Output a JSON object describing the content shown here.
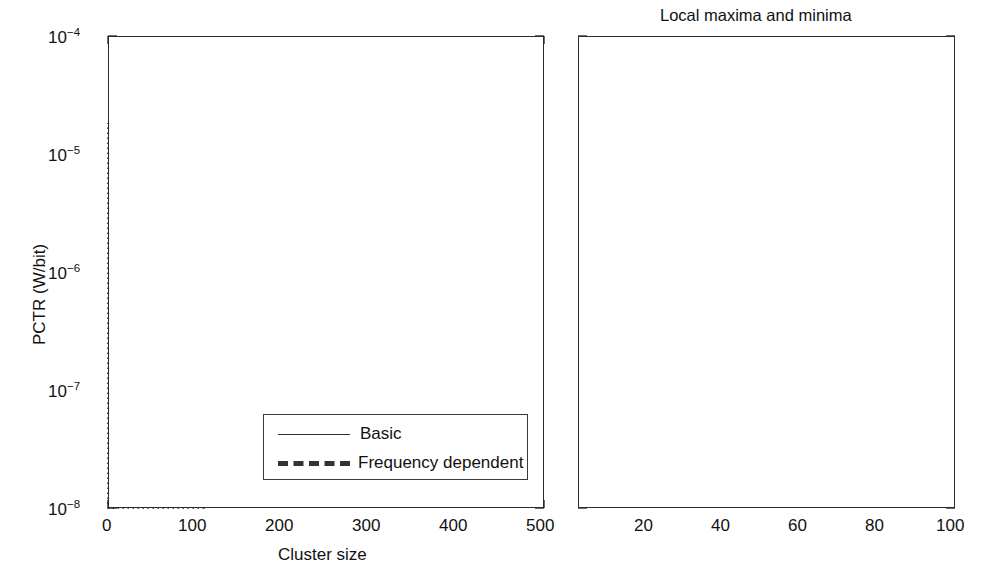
{
  "figure": {
    "background": "#ffffff",
    "ink_color": "#2b2b2b",
    "width": 992,
    "height": 575
  },
  "left_panel": {
    "title": "",
    "xlabel": "Cluster size",
    "ylabel": "PCTR (W/bit)",
    "xticks": [
      "0",
      "100",
      "200",
      "300",
      "400",
      "500"
    ],
    "yticks": [
      "10",
      "10",
      "10",
      "10",
      "10"
    ],
    "yexponents": [
      "-4",
      "-5",
      "-6",
      "-7",
      "-8"
    ],
    "zoom_box_note": "dotted rectangle marking region x 0-110"
  },
  "right_panel": {
    "title": "Local maxima and minima",
    "xlabel": "",
    "ylabel": "",
    "xticks": [
      "20",
      "40",
      "60",
      "80",
      "100"
    ]
  },
  "legend": {
    "items": [
      {
        "label": "Basic",
        "style": "solid-thin",
        "color": "#333333"
      },
      {
        "label": "Frequency dependent",
        "style": "dashed-thick",
        "color": "#333333"
      }
    ]
  },
  "chart_data": {
    "type": "line",
    "title": "Local maxima and minima",
    "xlabel": "Cluster size",
    "ylabel": "PCTR (W/bit)",
    "yscale": "log",
    "xlim": [
      0,
      500
    ],
    "ylim": [
      1e-08,
      0.0001
    ],
    "grid": "right panel vertical dashed gridlines at 20,40,60,80,100",
    "legend_position": "lower right of left panel",
    "annotations": [
      {
        "type": "zoom-rectangle",
        "style": "dotted",
        "x_range": [
          0,
          110
        ],
        "y_range": [
          1e-08,
          1.8e-05
        ],
        "note": "marks the region expanded in the right panel"
      }
    ],
    "panels": [
      {
        "name": "left",
        "xlim": [
          0,
          500
        ],
        "ylim": [
          1e-08,
          0.0001
        ],
        "yscale": "log",
        "xticks": [
          0,
          100,
          200,
          300,
          400,
          500
        ],
        "yticks": [
          1e-08,
          1e-07,
          1e-06,
          1e-05,
          0.0001
        ],
        "series": [
          {
            "name": "Basic",
            "style": "solid-thin",
            "x": [
              1,
              2,
              3,
              4,
              5,
              6,
              8,
              10,
              12,
              14,
              16,
              18,
              20,
              22,
              24,
              26,
              28,
              30,
              33,
              36,
              39,
              42,
              45,
              48,
              50,
              55,
              60,
              65,
              70,
              75,
              80,
              85,
              90,
              95,
              100,
              110,
              120,
              130,
              140,
              150,
              160,
              170,
              180,
              190,
              200,
              215,
              230,
              245,
              260,
              275,
              290,
              305,
              320,
              335,
              350,
              365,
              380,
              395,
              410,
              425,
              440,
              455,
              470,
              485,
              500
            ],
            "y": [
              9e-07,
              1.05e-06,
              1.3e-06,
              1.55e-06,
              1.8e-06,
              2e-06,
              2.3e-06,
              2.55e-06,
              2.75e-06,
              2.95e-06,
              3.1e-06,
              3.25e-06,
              3.4e-06,
              3.55e-06,
              3.7e-06,
              3.85e-06,
              3.95e-06,
              4.05e-06,
              4.25e-06,
              4.4e-06,
              4.55e-06,
              4.7e-06,
              4.85e-06,
              4.95e-06,
              5.05e-06,
              5.3e-06,
              5.5e-06,
              5.7e-06,
              5.85e-06,
              6e-06,
              6.15e-06,
              6.3e-06,
              6.45e-06,
              6.6e-06,
              6.75e-06,
              7e-06,
              7.25e-06,
              7.5e-06,
              7.75e-06,
              8e-06,
              8.25e-06,
              8.45e-06,
              8.65e-06,
              8.85e-06,
              9.05e-06,
              9.35e-06,
              9.65e-06,
              9.95e-06,
              1.02e-05,
              1.05e-05,
              1.08e-05,
              1.1e-05,
              1.12e-05,
              1.15e-05,
              1.17e-05,
              1.19e-05,
              1.21e-05,
              1.23e-05,
              1.25e-05,
              1.27e-05,
              1.29e-05,
              1.31e-05,
              1.33e-05,
              1.35e-05,
              1.37e-05
            ],
            "shape": "monotone increasing with periodic small sawtooth drops"
          },
          {
            "name": "Frequency dependent",
            "style": "dashed-thick",
            "x": [
              1,
              2,
              3,
              4,
              5,
              6,
              8,
              10,
              12,
              14,
              16,
              18,
              20,
              22,
              25,
              28,
              31,
              34,
              37,
              40,
              43,
              46,
              49,
              50,
              55,
              60,
              65,
              70,
              75,
              80,
              85,
              90,
              95,
              100,
              115,
              130,
              145,
              160,
              175,
              190,
              205,
              220,
              235,
              250,
              265,
              280,
              295,
              310,
              325,
              340,
              355,
              370,
              385,
              400,
              415,
              430,
              445,
              460,
              475,
              490,
              500
            ],
            "y": [
              2.1e-08,
              2.6e-08,
              3e-08,
              3.4e-08,
              3.7e-08,
              4e-08,
              4.7e-08,
              5.2e-08,
              5.6e-08,
              6.2e-08,
              6.6e-08,
              7e-08,
              7.4e-08,
              7.8e-08,
              8.4e-08,
              8.9e-08,
              9.4e-08,
              1e-07,
              1.05e-07,
              1.1e-07,
              1.15e-07,
              1.2e-07,
              1.25e-07,
              1.45e-07,
              1.52e-07,
              1.58e-07,
              1.64e-07,
              1.7e-07,
              1.76e-07,
              1.82e-07,
              1.88e-07,
              1.94e-07,
              2e-07,
              2.05e-07,
              2.15e-07,
              2.25e-07,
              2.34e-07,
              2.42e-07,
              2.5e-07,
              2.58e-07,
              2.66e-07,
              2.73e-07,
              2.8e-07,
              2.87e-07,
              2.94e-07,
              3.01e-07,
              3.08e-07,
              3.14e-07,
              3.2e-07,
              3.26e-07,
              3.32e-07,
              3.38e-07,
              3.44e-07,
              3.5e-07,
              3.56e-07,
              3.62e-07,
              3.68e-07,
              3.74e-07,
              3.8e-07,
              3.86e-07,
              3.92e-07
            ],
            "shape": "monotone increasing, noisy, with a step jump near cluster size 50"
          }
        ]
      },
      {
        "name": "right",
        "xlim": [
          5,
          102
        ],
        "ylim": [
          1e-08,
          0.0001
        ],
        "yscale": "log",
        "xticks": [
          20,
          40,
          60,
          80,
          100
        ],
        "gridlines_x": [
          20,
          40,
          60,
          80,
          100
        ],
        "series": [
          {
            "name": "Basic",
            "style": "solid-thin",
            "x": [
              5,
              6,
              7,
              8,
              9,
              10,
              11,
              12,
              13,
              14,
              15,
              16,
              17,
              18,
              19,
              20,
              21,
              22,
              23,
              24,
              25,
              26,
              27,
              28,
              29,
              30,
              31,
              32,
              33,
              34,
              35,
              36,
              37,
              38,
              39,
              40,
              41,
              42,
              43,
              44,
              45,
              46,
              47,
              48,
              49,
              50,
              51,
              52,
              53,
              54,
              55,
              56,
              57,
              58,
              59,
              60,
              62,
              64,
              66,
              68,
              70,
              72,
              74,
              76,
              78,
              80,
              82,
              84,
              86,
              88,
              90,
              92,
              94,
              96,
              98,
              100,
              101,
              102
            ],
            "y": [
              1.8e-06,
              2.1e-06,
              1.85e-06,
              2.1e-06,
              2.35e-06,
              2.6e-06,
              2.85e-06,
              3.05e-06,
              2.75e-06,
              2.95e-06,
              3.15e-06,
              3.35e-06,
              3.5e-06,
              3.65e-06,
              3.3e-06,
              3.45e-06,
              3.6e-06,
              3.75e-06,
              3.9e-06,
              4.05e-06,
              4.15e-06,
              4.25e-06,
              4.35e-06,
              3.95e-06,
              4.1e-06,
              4.25e-06,
              4.35e-06,
              4.45e-06,
              4.55e-06,
              4.65e-06,
              4.75e-06,
              4.85e-06,
              4.95e-06,
              5.05e-06,
              5.15e-06,
              4.75e-06,
              4.85e-06,
              4.95e-06,
              5.05e-06,
              5.15e-06,
              5.25e-06,
              5.35e-06,
              5.45e-06,
              5.55e-06,
              5.65e-06,
              5.2e-06,
              5.3e-06,
              5.4e-06,
              5.5e-06,
              5.58e-06,
              5.66e-06,
              5.74e-06,
              5.82e-06,
              5.9e-06,
              5.98e-06,
              6.06e-06,
              6.18e-06,
              6.3e-06,
              6.4e-06,
              6.5e-06,
              6.58e-06,
              6.66e-06,
              6.74e-06,
              6.82e-06,
              6.9e-06,
              6.4e-06,
              6.5e-06,
              6.6e-06,
              6.7e-06,
              6.8e-06,
              6.9e-06,
              7e-06,
              7.1e-06,
              7.2e-06,
              7.3e-06,
              7.4e-06,
              6.95e-06,
              7.05e-06
            ],
            "shape": "sawtooth — rises then drops at regular intervals (local maxima and minima)"
          },
          {
            "name": "Frequency dependent",
            "style": "dashed-thick",
            "x": [
              5,
              6,
              7,
              8,
              9,
              10,
              11,
              12,
              13,
              14,
              15,
              16,
              17,
              18,
              19,
              20,
              21,
              22,
              23,
              24,
              25,
              26,
              27,
              28,
              29,
              30,
              31,
              32,
              33,
              34,
              35,
              36,
              37,
              38,
              39,
              40,
              41,
              42,
              43,
              44,
              45,
              46,
              47,
              48,
              49,
              50,
              51,
              52,
              53,
              54,
              55,
              56,
              58,
              60,
              62,
              64,
              66,
              68,
              70,
              72,
              74,
              76,
              78,
              80,
              82,
              84,
              86,
              88,
              90,
              92,
              94,
              96,
              98,
              100,
              101
            ],
            "y": [
              3.55e-08,
              3.95e-08,
              4.3e-08,
              4.55e-08,
              4.85e-08,
              5.05e-08,
              5.15e-08,
              5.4e-08,
              5.8e-08,
              6.2e-08,
              6.55e-08,
              6.9e-08,
              7e-08,
              6.8e-08,
              6.95e-08,
              7.1e-08,
              7.4e-08,
              7.75e-08,
              8.05e-08,
              8.15e-08,
              8.05e-08,
              8.2e-08,
              8.45e-08,
              8.75e-08,
              9e-08,
              9.2e-08,
              9.15e-08,
              9.3e-08,
              9.55e-08,
              9.75e-08,
              9.9e-08,
              9.8e-08,
              9.95e-08,
              1.01e-07,
              1.03e-07,
              1.04e-07,
              1.06e-07,
              1.08e-07,
              1.07e-07,
              1.09e-07,
              1.13e-07,
              1.18e-07,
              1.25e-07,
              1.33e-07,
              1.42e-07,
              1.52e-07,
              1.56e-07,
              1.54e-07,
              1.57e-07,
              1.61e-07,
              1.65e-07,
              1.68e-07,
              1.72e-07,
              1.75e-07,
              1.73e-07,
              1.76e-07,
              1.79e-07,
              1.82e-07,
              1.8e-07,
              1.83e-07,
              1.87e-07,
              1.91e-07,
              1.95e-07,
              1.98e-07,
              1.96e-07,
              1.99e-07,
              2.02e-07,
              2.05e-07,
              2.08e-07,
              2.11e-07,
              2.14e-07,
              2.17e-07,
              2.2e-07,
              2.24e-07,
              2.26e-07
            ],
            "shape": "noisy increasing with step near 50"
          }
        ]
      }
    ]
  }
}
